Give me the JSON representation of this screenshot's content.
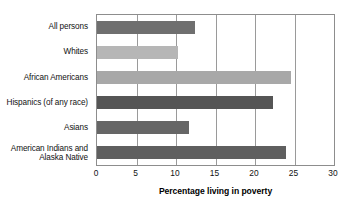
{
  "chart_data": {
    "type": "bar",
    "orientation": "horizontal",
    "title": "",
    "xlabel": "Percentage living in poverty",
    "ylabel": "",
    "xlim": [
      0,
      30
    ],
    "xticks": [
      0,
      5,
      10,
      15,
      20,
      25,
      30
    ],
    "xtick_labels": [
      "0",
      "5",
      "10",
      "15",
      "20",
      "25",
      "30"
    ],
    "grid": true,
    "legend": "none",
    "categories": [
      "All persons",
      "Whites",
      "African Americans",
      "Hispanics (of any race)",
      "Asians",
      "American Indians and\nAlaska Native"
    ],
    "values": [
      12.4,
      10.2,
      24.5,
      22.3,
      11.6,
      23.9
    ],
    "bar_colors": [
      "#6f6f6f",
      "#b6b6b6",
      "#a8a8a8",
      "#555555",
      "#666666",
      "#5f5f5f"
    ],
    "axis_color": "#8d8d8d",
    "gridline_color": "#9a9a9a",
    "background_color": "#ffffff",
    "text_color": "#111111"
  }
}
